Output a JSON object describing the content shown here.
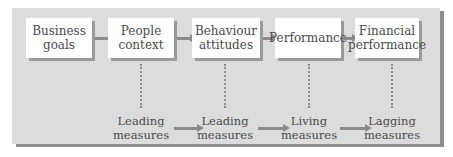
{
  "stages": [
    {
      "label": "Business goals",
      "line1": "Business",
      "line2": "goals"
    },
    {
      "label": "People context",
      "line1": "People",
      "line2": "context"
    },
    {
      "label": "Behaviour attitudes",
      "line1": "Behaviour",
      "line2": "attitudes"
    },
    {
      "label": "Performance",
      "line1": "Performance",
      "line2": ""
    },
    {
      "label": "Financial performance",
      "line1": "Financial",
      "line2": "performance"
    }
  ],
  "measures": [
    {
      "line1": "Leading",
      "line2": "measures"
    },
    {
      "line1": "Leading",
      "line2": "measures"
    },
    {
      "line1": "Living",
      "line2": "measures"
    },
    {
      "line1": "Lagging",
      "line2": "measures"
    }
  ],
  "colors": {
    "panel": "#dcdcdc",
    "panel_shadow": "#8d8d8d",
    "box": "#ffffff",
    "box_shadow": "#9a9a9a",
    "arrow": "#8a8a8a",
    "text": "#4a4a4a"
  }
}
